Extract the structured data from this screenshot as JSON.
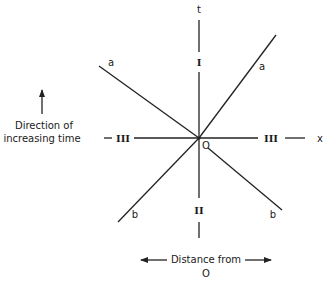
{
  "diagram": {
    "type": "space-time diagram",
    "axes": {
      "vertical_label": "t",
      "horizontal_label": "x",
      "origin_label": "O"
    },
    "regions": {
      "top": "I",
      "bottom": "II",
      "left": "III",
      "right": "III"
    },
    "lines": [
      {
        "name": "a",
        "label_left": "a",
        "label_right": "a",
        "description": "line through O from lower-left... upper-left to upper-right"
      },
      {
        "name": "b",
        "label_left": "b",
        "label_right": "b"
      }
    ],
    "line_labels": {
      "a_left": "a",
      "a_right": "a",
      "b_left": "b",
      "b_right": "b"
    },
    "captions": {
      "time_direction_line1": "Direction of",
      "time_direction_line2": "increasing time",
      "distance_line1": "Distance from",
      "distance_line2": "O"
    }
  }
}
